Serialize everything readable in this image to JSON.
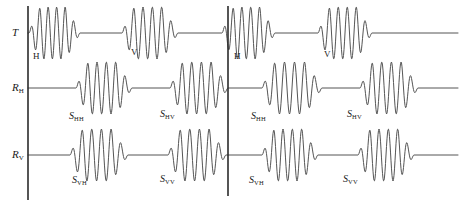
{
  "figure": {
    "stroke_color": "#555555",
    "axis_color": "#2b2b2b",
    "background": "#ffffff",
    "width": 460,
    "height": 208
  },
  "axes": [
    {
      "name": "transmit",
      "label": "T",
      "subscript": "",
      "baseline_y": 33
    },
    {
      "name": "receive-h",
      "label": "R",
      "subscript": "H",
      "baseline_y": 88
    },
    {
      "name": "receive-v",
      "label": "R",
      "subscript": "V",
      "baseline_y": 155
    }
  ],
  "dividers": [
    {
      "name": "left-axis",
      "x": 28,
      "y_top": 6,
      "y_bottom": 200
    },
    {
      "name": "cycle-divider",
      "x": 228,
      "y_top": 6,
      "y_bottom": 196
    }
  ],
  "polarization_marks": [
    {
      "text": "H",
      "x": 33,
      "y": 52,
      "cycle": 1
    },
    {
      "text": "V",
      "x": 131,
      "y": 48,
      "cycle": 1
    },
    {
      "text": "H",
      "x": 234,
      "y": 52,
      "cycle": 2
    },
    {
      "text": "V",
      "x": 324,
      "y": 50,
      "cycle": 2
    }
  ],
  "scatter_labels": [
    {
      "base": "S",
      "sub": "HH",
      "x": 69,
      "y": 111,
      "row": "receive-h",
      "cycle": 1
    },
    {
      "base": "S",
      "sub": "HV",
      "x": 160,
      "y": 109,
      "row": "receive-h",
      "cycle": 1
    },
    {
      "base": "S",
      "sub": "HH",
      "x": 251,
      "y": 111,
      "row": "receive-h",
      "cycle": 2
    },
    {
      "base": "S",
      "sub": "HV",
      "x": 347,
      "y": 109,
      "row": "receive-h",
      "cycle": 2
    },
    {
      "base": "S",
      "sub": "VH",
      "x": 72,
      "y": 175,
      "row": "receive-v",
      "cycle": 1
    },
    {
      "base": "S",
      "sub": "VV",
      "x": 160,
      "y": 174,
      "row": "receive-v",
      "cycle": 1
    },
    {
      "base": "S",
      "sub": "VH",
      "x": 249,
      "y": 175,
      "row": "receive-v",
      "cycle": 2
    },
    {
      "base": "S",
      "sub": "VV",
      "x": 343,
      "y": 174,
      "row": "receive-v",
      "cycle": 2
    }
  ],
  "chart_data": {
    "type": "line",
    "title": "",
    "xlabel": "",
    "ylabel": "",
    "grid": false,
    "legend": false,
    "pulse_cycles": 4,
    "oscillations_per_burst": 6,
    "series": [
      {
        "name": "T",
        "baseline_y": 33,
        "amplitude": 26,
        "bursts": [
          {
            "start": 29,
            "end": 80,
            "polarization": "H",
            "cycle": 1
          },
          {
            "start": 122,
            "end": 178,
            "polarization": "V",
            "cycle": 1
          },
          {
            "start": 222,
            "end": 275,
            "polarization": "H",
            "cycle": 2
          },
          {
            "start": 318,
            "end": 372,
            "polarization": "V",
            "cycle": 2
          }
        ],
        "line_end": 458
      },
      {
        "name": "R_H",
        "baseline_y": 88,
        "amplitude": 26,
        "bursts": [
          {
            "start": 76,
            "end": 132,
            "label": "S_HH",
            "cycle": 1
          },
          {
            "start": 170,
            "end": 228,
            "label": "S_HV",
            "cycle": 1
          },
          {
            "start": 262,
            "end": 322,
            "label": "S_HH",
            "cycle": 2
          },
          {
            "start": 360,
            "end": 418,
            "label": "S_HV",
            "cycle": 2
          }
        ],
        "line_end": 458
      },
      {
        "name": "R_V",
        "baseline_y": 155,
        "amplitude": 26,
        "bursts": [
          {
            "start": 70,
            "end": 128,
            "label": "S_VH",
            "cycle": 1
          },
          {
            "start": 168,
            "end": 226,
            "label": "S_VV",
            "cycle": 1
          },
          {
            "start": 262,
            "end": 318,
            "label": "S_VH",
            "cycle": 2
          },
          {
            "start": 358,
            "end": 414,
            "label": "S_VV",
            "cycle": 2
          }
        ],
        "line_end": 458
      }
    ]
  }
}
